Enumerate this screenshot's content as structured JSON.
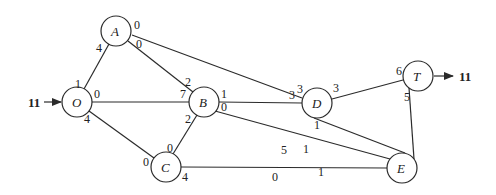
{
  "diagram": {
    "type": "network-flow",
    "source_flow": {
      "label": "11",
      "node": "O"
    },
    "sink_flow": {
      "label": "11",
      "node": "T"
    },
    "nodes": [
      {
        "id": "O",
        "label": "O",
        "x": 76,
        "y": 133
      },
      {
        "id": "A",
        "label": "A",
        "x": 116,
        "y": 33
      },
      {
        "id": "B",
        "label": "B",
        "x": 203,
        "y": 104
      },
      {
        "id": "C",
        "label": "C",
        "x": 165,
        "y": 168
      },
      {
        "id": "D",
        "label": "D",
        "x": 317,
        "y": 104
      },
      {
        "id": "E",
        "label": "E",
        "x": 402,
        "y": 170
      },
      {
        "id": "T",
        "label": "T",
        "x": 418,
        "y": 76
      }
    ],
    "edges": [
      {
        "from": "O",
        "to": "A",
        "from_label": "1",
        "to_label": "4"
      },
      {
        "from": "O",
        "to": "B",
        "from_label": "0",
        "to_label": "7"
      },
      {
        "from": "O",
        "to": "C",
        "from_label": "4",
        "to_label": "0"
      },
      {
        "from": "A",
        "to": "B",
        "from_label": "0",
        "to_label": "2"
      },
      {
        "from": "A",
        "to": "D",
        "from_label": "0",
        "to_label": "3"
      },
      {
        "from": "B",
        "to": "C",
        "from_label": "2",
        "to_label": "0"
      },
      {
        "from": "B",
        "to": "D",
        "from_label": "1",
        "to_label": "3"
      },
      {
        "from": "B",
        "to": "E",
        "from_label": "0",
        "to_label": "5"
      },
      {
        "from": "C",
        "to": "E",
        "from_label": "4",
        "to_label": "0"
      },
      {
        "from": "D",
        "to": "E",
        "from_label": "1",
        "to_label": "1"
      },
      {
        "from": "D",
        "to": "T",
        "from_label": "3",
        "to_label": "6"
      },
      {
        "from": "E",
        "to": "T",
        "from_label": "1",
        "to_label": "5"
      }
    ]
  }
}
